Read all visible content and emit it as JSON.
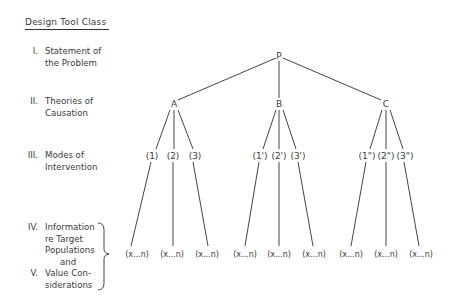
{
  "title": "Design Tool Class",
  "levels": [
    {
      "numeral": "I.",
      "lines": [
        "Statement of",
        "the Problem"
      ]
    },
    {
      "numeral": "II.",
      "lines": [
        "Theories of",
        "Causation"
      ]
    },
    {
      "numeral": "III.",
      "lines": [
        "Modes of",
        "Intervention"
      ]
    },
    {
      "numeral": "IV.",
      "lines": [
        "Information",
        "re Target",
        "Populations"
      ]
    },
    {
      "connector": "and"
    },
    {
      "numeral": "V.",
      "lines": [
        "Value Con-",
        "siderations"
      ]
    }
  ],
  "tree": {
    "root": "P",
    "theories": [
      "A",
      "B",
      "C"
    ],
    "modes": [
      [
        "(1)",
        "(2)",
        "(3)"
      ],
      [
        "(1')",
        "(2')",
        "(3')"
      ],
      [
        "(1\")",
        "(2\")",
        "(3\")"
      ]
    ],
    "leaf_label": "(x...n)"
  }
}
